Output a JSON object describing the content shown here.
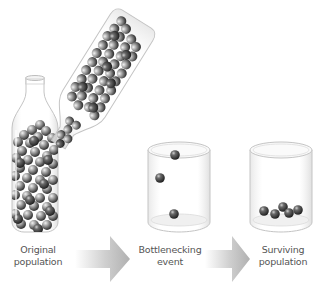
{
  "diagram": {
    "title": "Population bottleneck",
    "stages": [
      {
        "id": "original",
        "line1": "Original",
        "line2": "population",
        "container": "bottle",
        "marble_count": "many"
      },
      {
        "id": "bottleneck",
        "line1": "Bottlenecking",
        "line2": "event",
        "container": "glass",
        "marble_count": 3
      },
      {
        "id": "surviving",
        "line1": "Surviving",
        "line2": "population",
        "container": "glass",
        "marble_count": 5
      }
    ],
    "arrows": [
      {
        "from": "original",
        "to": "bottleneck",
        "icon": "arrow-right-icon"
      },
      {
        "from": "bottleneck",
        "to": "surviving",
        "icon": "arrow-right-icon"
      }
    ],
    "tilted_bottle": {
      "description": "bottle pouring marbles into glass"
    },
    "colors": {
      "marble_dark": "#3a3a3a",
      "marble_light": "#d8d8d8",
      "glass_outline": "#c4c4c4",
      "arrow": "#b5b5b5",
      "label_text": "#555555",
      "background": "#ffffff"
    }
  }
}
